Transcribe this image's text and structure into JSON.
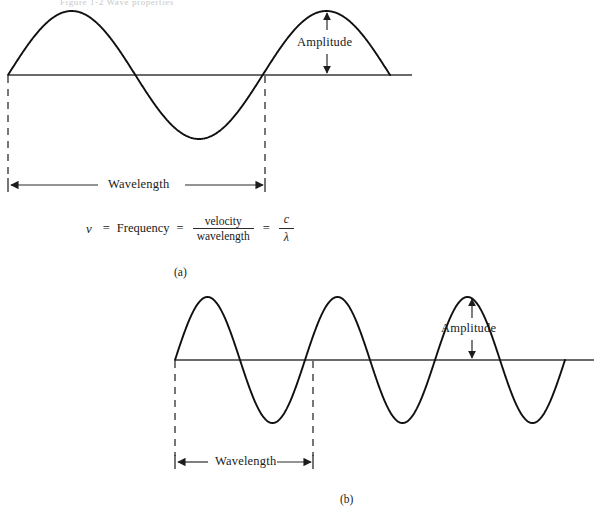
{
  "figure": {
    "top_crumb": "Figure 1-2  Wave properties",
    "background_color": "#ffffff",
    "stroke_color": "#101010",
    "axis_color": "#3a3a3a",
    "dash_color": "#4a4a4a"
  },
  "panel_a": {
    "part_label": "(a)",
    "amplitude_label": "Amplitude",
    "wavelength_label": "Wavelength",
    "cycles": 1,
    "baseline_y": 75,
    "amplitude_px": 64,
    "wave_start_x": 8,
    "wave_end_x": 390,
    "axis_end_x": 412,
    "wavelength_start_x": 8,
    "wavelength_end_x": 266,
    "amplitude_arrow_x": 327
  },
  "panel_b": {
    "part_label": "(b)",
    "amplitude_label": "Amplitude",
    "wavelength_label": "Wavelength",
    "cycles": 3,
    "baseline_y": 360,
    "amplitude_px": 63,
    "wave_start_x": 175,
    "wave_end_x": 565,
    "axis_start_x": 175,
    "axis_end_x": 594,
    "wavelength_start_x": 175,
    "wavelength_end_x": 313,
    "amplitude_arrow_x": 472
  },
  "equation": {
    "symbol": "ν",
    "equals_1": "=",
    "term_frequency": "Frequency",
    "equals_2": "=",
    "fraction_1_numerator": "velocity",
    "fraction_1_denominator": "wavelength",
    "equals_3": "=",
    "fraction_2_numerator": "c",
    "fraction_2_denominator": "λ"
  },
  "chart_data": {
    "type": "line",
    "xlabel": "",
    "ylabel": "",
    "grid": false,
    "legend_position": "none",
    "series": [
      {
        "name": "wave (a) — low frequency, long wavelength",
        "function": "sine",
        "cycles": 1,
        "amplitude": 1.0,
        "wavelength_px": 258,
        "annotations": [
          "Wavelength",
          "Amplitude"
        ]
      },
      {
        "name": "wave (b) — high frequency, short wavelength",
        "function": "sine",
        "cycles": 3,
        "amplitude": 1.0,
        "wavelength_px": 138,
        "annotations": [
          "Wavelength",
          "Amplitude"
        ]
      }
    ],
    "relationship": "ν = Frequency = velocity / wavelength = c / λ"
  }
}
